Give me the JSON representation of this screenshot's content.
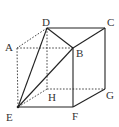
{
  "diagram": {
    "type": "cube",
    "colors": {
      "line": "#222222",
      "dashed": "#333333",
      "label": "#333333",
      "background": "#ffffff"
    },
    "vertices": {
      "A": {
        "label": "A",
        "x": 17,
        "y": 48
      },
      "B": {
        "label": "B",
        "x": 73,
        "y": 48
      },
      "C": {
        "label": "C",
        "x": 105,
        "y": 28
      },
      "D": {
        "label": "D",
        "x": 47,
        "y": 28
      },
      "E": {
        "label": "E",
        "x": 18,
        "y": 107
      },
      "F": {
        "label": "F",
        "x": 73,
        "y": 107
      },
      "G": {
        "label": "G",
        "x": 105,
        "y": 89
      },
      "H": {
        "label": "H",
        "x": 47,
        "y": 89
      }
    },
    "solid_edges": [
      "D-C",
      "D-B",
      "B-C",
      "C-G",
      "G-F",
      "F-B",
      "E-F",
      "E-D",
      "E-B"
    ],
    "dashed_edges": [
      "D-A",
      "A-B",
      "A-E",
      "D-H",
      "H-G",
      "H-E"
    ]
  }
}
